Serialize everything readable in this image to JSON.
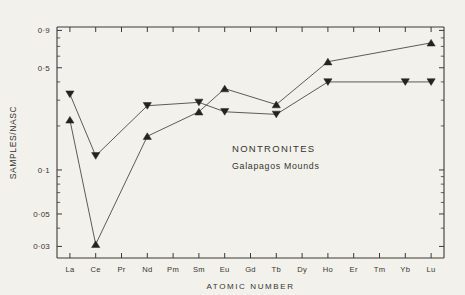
{
  "chart_data": {
    "type": "line",
    "title": "",
    "annotation_title": "NONTRONITES",
    "annotation_subtitle": "Galapagos  Mounds",
    "xlabel": "ATOMIC   NUMBER",
    "ylabel": "SAMPLES/NASC",
    "categories": [
      "La",
      "Ce",
      "Pr",
      "Nd",
      "Pm",
      "Sm",
      "Eu",
      "Gd",
      "Tb",
      "Dy",
      "Ho",
      "Er",
      "Tm",
      "Yb",
      "Lu"
    ],
    "yscale": "log",
    "ylim": [
      0.025,
      0.95
    ],
    "ytick_labels": [
      "0·9",
      "0·5",
      "0·1",
      "0·05",
      "0·03"
    ],
    "ytick_values": [
      0.9,
      0.5,
      0.1,
      0.05,
      0.03
    ],
    "grid": false,
    "legend": "none",
    "series": [
      {
        "name": "upper",
        "marker": "triangle-down",
        "points": [
          {
            "x": "La",
            "y": 0.33
          },
          {
            "x": "Ce",
            "y": 0.125
          },
          {
            "x": "Nd",
            "y": 0.275
          },
          {
            "x": "Sm",
            "y": 0.29
          },
          {
            "x": "Eu",
            "y": 0.25
          },
          {
            "x": "Tb",
            "y": 0.24
          },
          {
            "x": "Ho",
            "y": 0.4
          },
          {
            "x": "Yb",
            "y": 0.4
          },
          {
            "x": "Lu",
            "y": 0.4
          }
        ]
      },
      {
        "name": "lower",
        "marker": "triangle-up",
        "points": [
          {
            "x": "La",
            "y": 0.22
          },
          {
            "x": "Ce",
            "y": 0.031
          },
          {
            "x": "Nd",
            "y": 0.17
          },
          {
            "x": "Sm",
            "y": 0.25
          },
          {
            "x": "Eu",
            "y": 0.36
          },
          {
            "x": "Tb",
            "y": 0.28
          },
          {
            "x": "Ho",
            "y": 0.55
          },
          {
            "x": "Lu",
            "y": 0.74
          }
        ]
      }
    ]
  }
}
